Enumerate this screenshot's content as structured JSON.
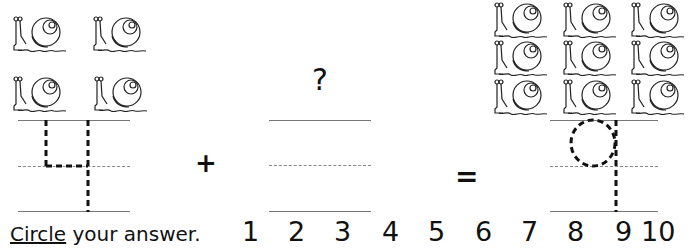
{
  "worksheet": {
    "left_group": {
      "snail_count": 4,
      "digit": "4"
    },
    "middle_group": {
      "question_mark": "?"
    },
    "right_group": {
      "snail_count": 9,
      "digit": "9"
    },
    "operators": {
      "plus": "+",
      "equals": "="
    },
    "prompt": {
      "underlined_word": "Circle",
      "rest": " your answer."
    },
    "answer_choices": [
      "1",
      "2",
      "3",
      "4",
      "5",
      "6",
      "7",
      "8",
      "9",
      "10"
    ]
  }
}
